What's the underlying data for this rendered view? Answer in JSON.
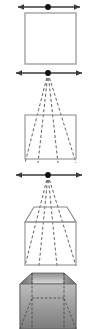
{
  "figure": {
    "panel_count": 4,
    "background_color": "#ffffff",
    "line_color": "#555555",
    "outline_color": "#808080",
    "dashed_color": "#444444",
    "horizon_color": "#3a3a3a",
    "vanishing_point_color": "#111111",
    "shade_top_light": "#d8d8d8",
    "shade_top_dark": "#8f8f8f",
    "shade_side_light": "#9a9a9a",
    "shade_side_dark": "#6a6a6a",
    "shade_front_light": "#bdbdbd",
    "shade_front_dark": "#7c7c7c"
  },
  "panels": [
    {
      "id": "panel-1",
      "label": "Step 1 - front face and horizon",
      "horizon": {
        "label": "horizon line",
        "y": 7,
        "x1": 18,
        "x2": 80
      },
      "vanishing_point": {
        "label": "vanishing point",
        "x": 48,
        "y": 7
      },
      "square": {
        "label": "front face square",
        "x": 25,
        "y": 13,
        "w": 51,
        "h": 51
      },
      "has_projectors": false,
      "has_top_face": false,
      "shaded": false
    },
    {
      "id": "panel-2",
      "label": "Step 2 - projectors from vanishing point",
      "horizon": {
        "label": "horizon line",
        "y": 9,
        "x1": 16,
        "x2": 82
      },
      "vanishing_point": {
        "label": "vanishing point",
        "x": 48,
        "y": 9
      },
      "square": {
        "label": "front face square",
        "x": 25,
        "y": 51,
        "w": 51,
        "h": 44
      },
      "has_projectors": true,
      "has_top_face": false,
      "shaded": false
    },
    {
      "id": "panel-3",
      "label": "Step 3 - depth plane added",
      "horizon": {
        "label": "horizon line",
        "y": 8,
        "x1": 16,
        "x2": 82
      },
      "vanishing_point": {
        "label": "vanishing point",
        "x": 48,
        "y": 8
      },
      "square": {
        "label": "front face square",
        "x": 25,
        "y": 55,
        "w": 51,
        "h": 43
      },
      "top_face": {
        "label": "receding top face",
        "y_back": 40,
        "x_back_left": 34,
        "x_back_right": 67
      },
      "has_projectors": true,
      "has_top_face": true,
      "shaded": false
    },
    {
      "id": "panel-4",
      "label": "Step 4 - shaded solid box",
      "horizon": null,
      "vanishing_point": null,
      "square": {
        "label": "box body",
        "x": 20,
        "y": 14,
        "w": 56,
        "h": 45
      },
      "has_projectors": false,
      "has_top_face": true,
      "shaded": true
    }
  ],
  "elements": {
    "horizon_line_name": "horizon-line",
    "vanishing_point_name": "vanishing-point",
    "left_arrow_name": "arrow-head-left",
    "right_arrow_name": "arrow-head-right",
    "square_name": "front-face-square",
    "projector_name": "projection-ray",
    "top_face_name": "top-face",
    "solid_box_name": "shaded-box"
  }
}
